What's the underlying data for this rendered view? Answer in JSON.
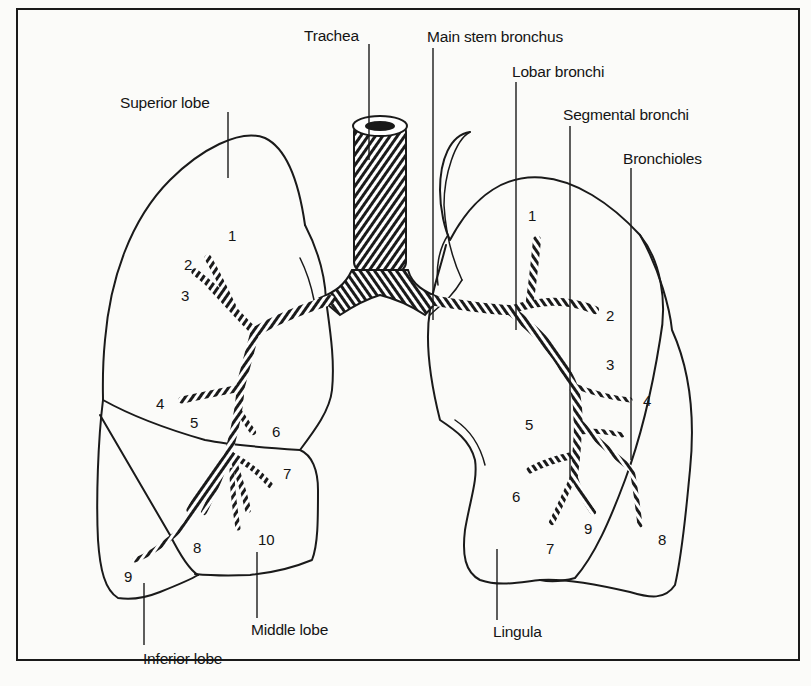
{
  "figure": {
    "type": "anatomical-diagram"
  },
  "labels": {
    "trachea": "Trachea",
    "main_stem_bronchus": "Main stem bronchus",
    "lobar_bronchi": "Lobar bronchi",
    "segmental_bronchi": "Segmental bronchi",
    "bronchioles": "Bronchioles",
    "superior_lobe": "Superior lobe",
    "middle_lobe": "Middle lobe",
    "inferior_lobe": "Inferior lobe",
    "lingula": "Lingula"
  },
  "right_lung_segments": [
    "1",
    "2",
    "3",
    "4",
    "5",
    "6",
    "7",
    "8",
    "9",
    "10"
  ],
  "left_lung_segments": [
    "1",
    "2",
    "3",
    "4",
    "5",
    "6",
    "7",
    "8",
    "9"
  ],
  "colors": {
    "ink": "#141414",
    "paper": "#fbfbf9"
  }
}
